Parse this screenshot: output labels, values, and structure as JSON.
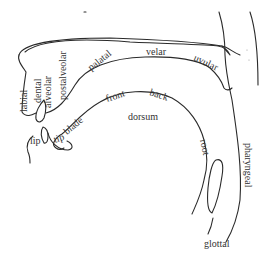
{
  "diagram": {
    "type": "vocal-tract-midsagittal",
    "labels": {
      "labial": "labial",
      "dental": "dental",
      "alveolar": "alveolar",
      "postalveolar": "postalveolar",
      "palatal": "palatal",
      "velar": "velar",
      "uvular": "uvular",
      "pharyngeal": "pharyngeal",
      "glottal": "glottal",
      "lip_upper": "lip",
      "lip_lower": "lip",
      "tip": "tip",
      "blade": "blade",
      "front": "front",
      "back": "back",
      "dorsum": "dorsum",
      "root": "root"
    },
    "colors": {
      "stroke": "#2a2a2a",
      "text": "#333333",
      "background": "#ffffff"
    }
  }
}
